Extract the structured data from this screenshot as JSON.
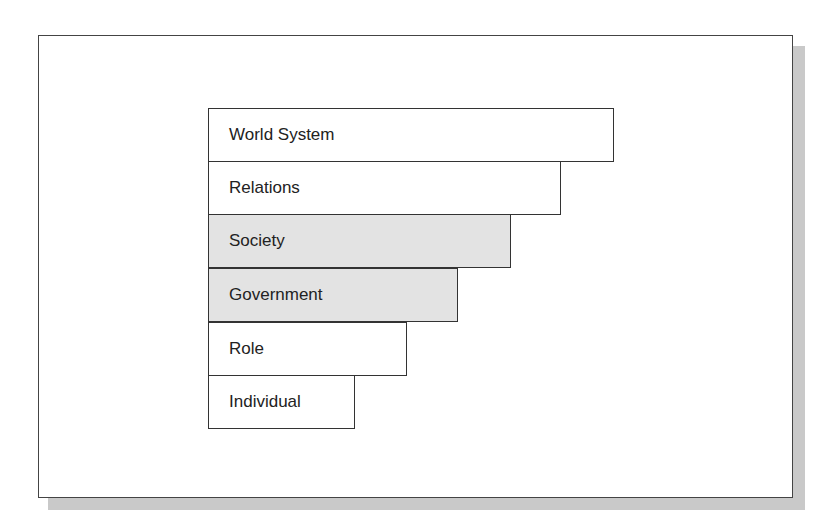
{
  "diagram": {
    "type": "staircase-levels-of-analysis",
    "levels": [
      {
        "label": "World System",
        "shaded": false,
        "top": 108,
        "right": 614
      },
      {
        "label": "Relations",
        "shaded": false,
        "top": 161,
        "right": 561
      },
      {
        "label": "Society",
        "shaded": true,
        "top": 214,
        "right": 511
      },
      {
        "label": "Government",
        "shaded": true,
        "top": 268,
        "right": 458
      },
      {
        "label": "Role",
        "shaded": false,
        "top": 322,
        "right": 407
      },
      {
        "label": "Individual",
        "shaded": false,
        "top": 375,
        "right": 355
      }
    ],
    "colors": {
      "shaded_fill": "#e3e3e3",
      "border": "#333333",
      "shadow": "#c9c9c9"
    }
  }
}
